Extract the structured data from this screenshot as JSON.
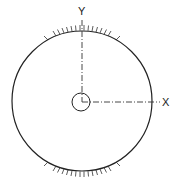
{
  "diagram": {
    "type": "engineering-sketch",
    "labels": {
      "y_axis": "Y",
      "x_axis": "X"
    },
    "colors": {
      "line": "#222222",
      "background": "#ffffff"
    }
  }
}
